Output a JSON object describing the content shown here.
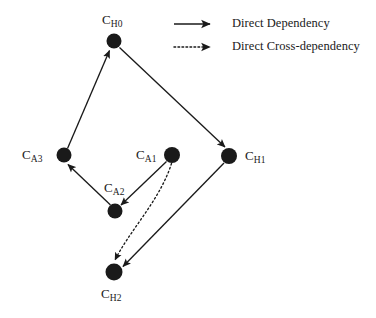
{
  "figure": {
    "type": "directed-graph",
    "background_color": "#ffffff",
    "ink_color": "#1a1a1a",
    "width": 376,
    "height": 318
  },
  "nodes": [
    {
      "id": "CH0",
      "base": "C",
      "sub": "H0",
      "label": "C_H0",
      "x": 114,
      "y": 41,
      "r": 7.5,
      "label_x": 102,
      "label_y": 13,
      "label_anchor": "left"
    },
    {
      "id": "CA3",
      "base": "C",
      "sub": "A3",
      "label": "C_A3",
      "x": 64,
      "y": 155,
      "r": 7.5,
      "label_x": 22,
      "label_y": 148,
      "label_anchor": "left"
    },
    {
      "id": "CA1",
      "base": "C",
      "sub": "A1",
      "label": "C_A1",
      "x": 172,
      "y": 155,
      "r": 8.0,
      "label_x": 136,
      "label_y": 148,
      "label_anchor": "left"
    },
    {
      "id": "CH1",
      "base": "C",
      "sub": "H1",
      "label": "C_H1",
      "x": 229,
      "y": 156,
      "r": 8.0,
      "label_x": 245,
      "label_y": 149,
      "label_anchor": "left"
    },
    {
      "id": "CA2",
      "base": "C",
      "sub": "A2",
      "label": "C_A2",
      "x": 115,
      "y": 211,
      "r": 7.5,
      "label_x": 104,
      "label_y": 181,
      "label_anchor": "left"
    },
    {
      "id": "CH2",
      "base": "C",
      "sub": "H2",
      "label": "C_H2",
      "x": 114,
      "y": 272,
      "r": 8.5,
      "label_x": 101,
      "label_y": 287,
      "label_anchor": "left"
    }
  ],
  "edges": [
    {
      "id": "a3-h0",
      "from": "CA3",
      "to": "CH0",
      "style": "solid",
      "kind": "direct-dependency"
    },
    {
      "id": "h0-h1",
      "from": "CH0",
      "to": "CH1",
      "style": "solid",
      "kind": "direct-dependency"
    },
    {
      "id": "a2-a3",
      "from": "CA2",
      "to": "CA3",
      "style": "solid",
      "kind": "direct-dependency"
    },
    {
      "id": "a1-a2",
      "from": "CA1",
      "to": "CA2",
      "style": "solid",
      "kind": "direct-dependency"
    },
    {
      "id": "h1-h2",
      "from": "CH1",
      "to": "CH2",
      "style": "solid",
      "kind": "direct-dependency"
    },
    {
      "id": "a1-h2",
      "from": "CA1",
      "to": "CH2",
      "style": "dotted",
      "kind": "direct-cross-dependency"
    }
  ],
  "legend": {
    "items": [
      {
        "id": "direct-dependency",
        "label": "Direct Dependency",
        "style": "solid",
        "line_x1": 174,
        "line_x2": 210,
        "line_y": 24,
        "text_x": 232,
        "text_y": 17
      },
      {
        "id": "direct-cross-dependency",
        "label": "Direct Cross-dependency",
        "style": "dotted",
        "line_x1": 174,
        "line_x2": 210,
        "line_y": 47,
        "text_x": 232,
        "text_y": 40
      }
    ]
  }
}
